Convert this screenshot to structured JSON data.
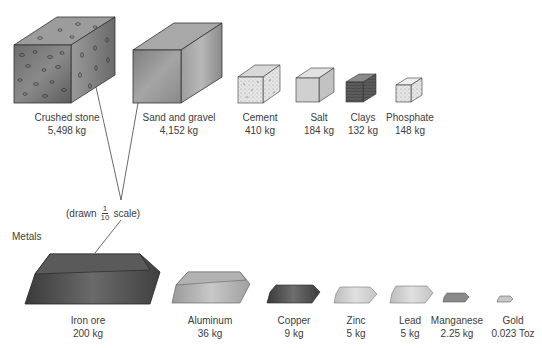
{
  "figure": {
    "scale_note": {
      "prefix": "(drawn",
      "numerator": "1",
      "denominator": "10",
      "suffix": "scale)"
    },
    "metals_heading": "Metals",
    "nonmetals": [
      {
        "name": "Crushed stone",
        "amount": "5,498 kg"
      },
      {
        "name": "Sand and gravel",
        "amount": "4,152 kg"
      },
      {
        "name": "Cement",
        "amount": "410 kg"
      },
      {
        "name": "Salt",
        "amount": "184 kg"
      },
      {
        "name": "Clays",
        "amount": "132 kg"
      },
      {
        "name": "Phosphate",
        "amount": "148 kg"
      }
    ],
    "metals": [
      {
        "name": "Iron ore",
        "amount": "200 kg"
      },
      {
        "name": "Aluminum",
        "amount": "36 kg"
      },
      {
        "name": "Copper",
        "amount": "9 kg"
      },
      {
        "name": "Zinc",
        "amount": "5 kg"
      },
      {
        "name": "Lead",
        "amount": "5 kg"
      },
      {
        "name": "Manganese",
        "amount": "2.25 kg"
      },
      {
        "name": "Gold",
        "amount": "0.023 Toz"
      }
    ]
  }
}
